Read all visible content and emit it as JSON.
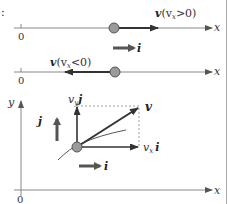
{
  "figure": {
    "colors": {
      "axis": "#777777",
      "vector": "#333333",
      "unit_vector": "#555555",
      "particle_fill": "#999999",
      "particle_stroke": "#555555",
      "dashed": "#888888",
      "border": "#aaaaaa"
    },
    "prefix_mark": ":",
    "panel1": {
      "axis_label": "x",
      "origin_label": "0",
      "velocity_label_main": "v",
      "velocity_label_cond": "(v",
      "velocity_label_sub": "x",
      "velocity_label_tail": ">0)",
      "unit_vector_label": "i"
    },
    "panel2": {
      "axis_label": "x",
      "origin_label": "0",
      "velocity_label_main": "v",
      "velocity_label_cond": "(v",
      "velocity_label_sub": "x",
      "velocity_label_tail": "<0)"
    },
    "panel3": {
      "x_axis_label": "x",
      "y_axis_label": "y",
      "origin_label": "0",
      "velocity_label": "v",
      "vy_component_coef": "v",
      "vy_component_sub": "y",
      "vy_component_unit": "j",
      "vx_component_coef": "v",
      "vx_component_sub": "x",
      "vx_component_unit": "i",
      "unit_j_label": "j",
      "unit_i_label": "i"
    }
  }
}
